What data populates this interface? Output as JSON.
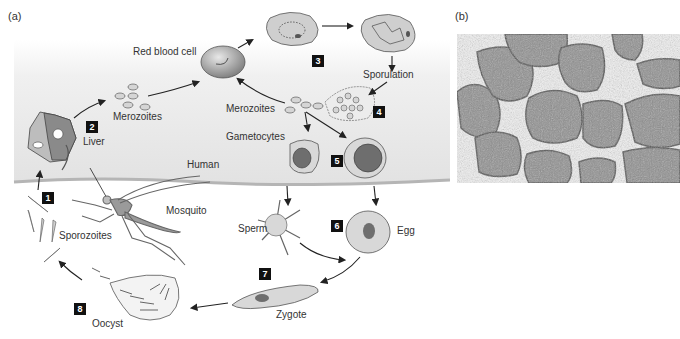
{
  "panels": {
    "a_label": "(a)",
    "b_label": "(b)"
  },
  "regions": {
    "human": "Human",
    "mosquito": "Mosquito"
  },
  "stages": [
    {
      "number": "1",
      "label": "Sporozoites"
    },
    {
      "number": "2",
      "label": "Liver"
    },
    {
      "number": "3",
      "label": ""
    },
    {
      "number": "4",
      "label": ""
    },
    {
      "number": "5",
      "label": ""
    },
    {
      "number": "6",
      "label": ""
    },
    {
      "number": "7",
      "label": "Zygote"
    },
    {
      "number": "8",
      "label": "Oocyst"
    }
  ],
  "labels": {
    "merozoites_liver": "Merozoites",
    "red_blood_cell": "Red blood cell",
    "sporulation": "Sporulation",
    "merozoites_blood": "Merozoites",
    "gametocytes": "Gametocytes",
    "sperm": "Sperm",
    "egg": "Egg",
    "zygote": "Zygote",
    "oocyst": "Oocyst",
    "sporozoites": "Sporozoites",
    "liver": "Liver"
  },
  "colors": {
    "human_band": "#e6e6e6",
    "skin_line": "#b5b5b5",
    "cell_fill": "#cfcfcf",
    "dark_fill": "#6e6e6e",
    "step_box": "#111111"
  }
}
